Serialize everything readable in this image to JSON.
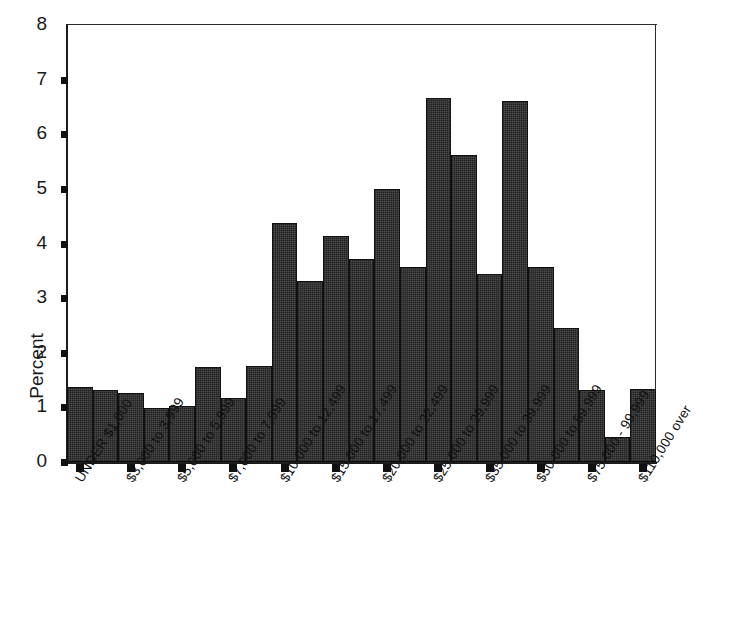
{
  "chart": {
    "type": "bar",
    "ylabel": "Percent",
    "xlabel": "",
    "title": ""
  },
  "chart_data": {
    "type": "bar",
    "title": "",
    "subtitle": "",
    "xlabel": "",
    "ylabel": "Percent",
    "ylim": [
      0,
      8
    ],
    "y_ticks": [
      "0",
      "1",
      "2",
      "3",
      "4",
      "5",
      "6",
      "7",
      "8"
    ],
    "grid": false,
    "legend": false,
    "bar_color": "#4a4a4a",
    "bar_edge_color": "#111111",
    "x_tick_labels": [
      "UNDER $1,000",
      "$3,000 to 3,999",
      "$5,000 to 5,999",
      "$7,000 to 7,999",
      "$10,000 to 12,499",
      "$15,000 to 17,499",
      "$20,000 to 22,499",
      "$25,000 to 29,999",
      "$35,000 to 39,999",
      "$50,000 to 59,999",
      "$75,000 - 99,999",
      "$110,000 over"
    ],
    "x_tick_bar_index": [
      0,
      2,
      4,
      6,
      8,
      10,
      12,
      14,
      16,
      18,
      20,
      22
    ],
    "categories": [
      "UNDER $1,000",
      "$1,000 to 2,999",
      "$3,000 to 3,999",
      "$4,000 to 4,999",
      "$5,000 to 5,999",
      "$6,000 to 6,999",
      "$7,000 to 7,999",
      "$8,000 to 9,999",
      "$10,000 to 12,499",
      "$12,500 to 14,999",
      "$15,000 to 17,499",
      "$17,500 to 19,999",
      "$20,000 to 22,499",
      "$22,500 to 24,999",
      "$25,000 to 29,999",
      "$30,000 to 34,999",
      "$35,000 to 39,999",
      "$40,000 to 49,999",
      "$50,000 to 59,999",
      "$60,000 to 74,999",
      "$75,000 - 99,999",
      "$100,000 to 109,999",
      "$110,000 over"
    ],
    "values": [
      1.38,
      1.32,
      1.26,
      0.98,
      1.03,
      1.74,
      1.17,
      1.76,
      4.37,
      3.31,
      4.14,
      3.72,
      4.99,
      3.57,
      6.66,
      5.62,
      3.44,
      6.6,
      3.57,
      2.45,
      1.32,
      0.45,
      1.33
    ]
  }
}
